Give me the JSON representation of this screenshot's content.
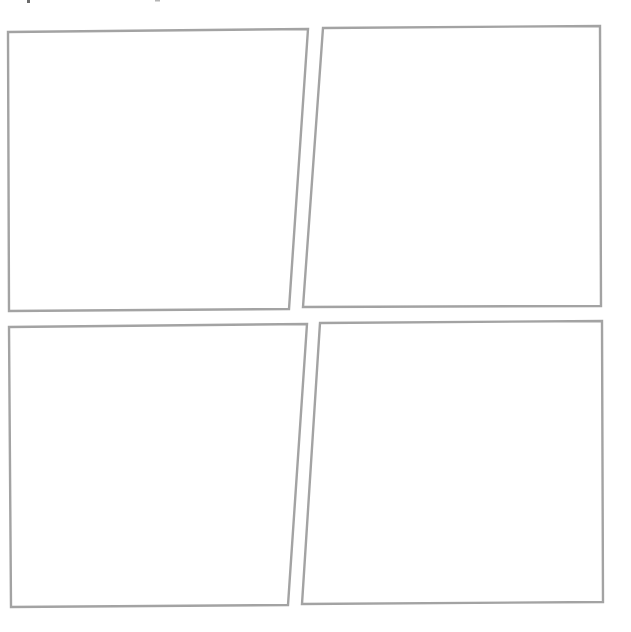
{
  "layout": {
    "background": "#ffffff",
    "border_color": "#a3a3a3",
    "grid": "2x2"
  },
  "panels": [
    {
      "id": "top-left",
      "label": "",
      "points": "8,32 308,29 289,309 9,311"
    },
    {
      "id": "top-right",
      "label": "",
      "points": "323,28 600,26 601,306 303,307"
    },
    {
      "id": "bottom-left",
      "label": "",
      "points": "9,327 307,324 288,605 11,607"
    },
    {
      "id": "bottom-right",
      "label": "",
      "points": "320,323 602,321 603,602 302,604"
    }
  ]
}
